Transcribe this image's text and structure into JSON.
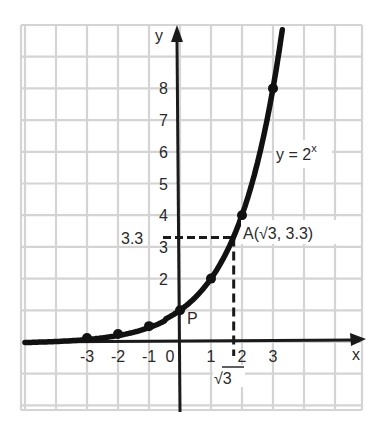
{
  "chart_data": {
    "type": "line",
    "title": "",
    "function_label": "y = 2^x",
    "function_label_base": "y = 2",
    "function_label_exp": "x",
    "xlabel": "x",
    "ylabel": "y",
    "x_ticks": [
      "-3",
      "-2",
      "-1",
      "0",
      "1",
      "2",
      "3"
    ],
    "y_ticks": [
      "1",
      "2",
      "3",
      "4",
      "5",
      "6",
      "7",
      "8"
    ],
    "xlim": [
      -5,
      6
    ],
    "ylim": [
      -2,
      10
    ],
    "grid": true,
    "series": [
      {
        "name": "y = 2^x",
        "points": [
          {
            "x": -3,
            "y": 0.125
          },
          {
            "x": -2,
            "y": 0.25
          },
          {
            "x": -1,
            "y": 0.5
          },
          {
            "x": 0,
            "y": 1
          },
          {
            "x": 1,
            "y": 2
          },
          {
            "x": 2,
            "y": 4
          },
          {
            "x": 3,
            "y": 8
          }
        ]
      }
    ],
    "annotations": [
      {
        "label": "P",
        "x": 0,
        "y": 1
      },
      {
        "label": "A(√3, 3.3)",
        "x": 1.732,
        "y": 3.3
      },
      {
        "label": "3.3",
        "type": "y-guide",
        "value": 3.3
      },
      {
        "label": "√3",
        "type": "x-guide",
        "value": 1.732
      }
    ]
  }
}
